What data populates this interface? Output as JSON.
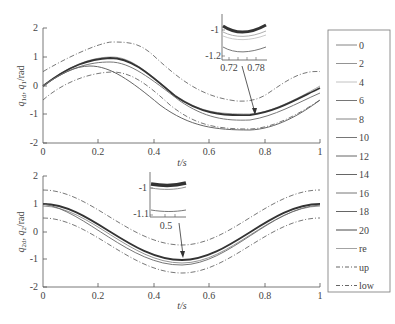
{
  "chart_data": [
    {
      "type": "line",
      "title": "",
      "xlabel": "t/s",
      "ylabel": "q1d, q1/rad",
      "ylabel_parts": {
        "a": "q",
        "a_sub": "1d",
        "sep": ", ",
        "b": "q",
        "b_sub": "1",
        "unit": "/rad"
      },
      "xlim": [
        0,
        1
      ],
      "ylim": [
        -2,
        2
      ],
      "xticks": [
        "0",
        "0.2",
        "0.4",
        "0.6",
        "0.8",
        "1"
      ],
      "yticks": [
        "2",
        "1",
        "0",
        "-1",
        "-2"
      ],
      "x": [
        0,
        0.1,
        0.2,
        0.25,
        0.3,
        0.4,
        0.5,
        0.6,
        0.7,
        0.75,
        0.8,
        0.9,
        1.0
      ],
      "series": [
        {
          "name": "up",
          "style": "dash-dot",
          "values": [
            0.5,
            1.09,
            1.45,
            1.5,
            1.45,
            1.09,
            0.5,
            -0.09,
            -0.45,
            -0.5,
            -0.45,
            -0.09,
            0.5
          ]
        },
        {
          "name": "re",
          "style": "solid",
          "values": [
            0.0,
            0.59,
            0.95,
            1.0,
            0.95,
            0.59,
            0.0,
            -0.59,
            -0.95,
            -1.0,
            -0.95,
            -0.59,
            0.0
          ]
        },
        {
          "name": "0",
          "style": "solid",
          "values": [
            0.0,
            0.55,
            0.7,
            0.68,
            0.6,
            0.3,
            -0.25,
            -0.75,
            -1.1,
            -1.18,
            -1.15,
            -0.9,
            -0.5
          ]
        },
        {
          "name": "low",
          "style": "dash-dot",
          "values": [
            -0.5,
            0.09,
            0.45,
            0.5,
            0.45,
            0.09,
            -0.5,
            -1.09,
            -1.45,
            -1.5,
            -1.45,
            -1.09,
            -0.5
          ]
        }
      ],
      "inset": {
        "xticks": [
          "0.72",
          "0.78"
        ],
        "yticks": [
          "-1",
          "-1.2"
        ],
        "points_to": [
          0.76,
          -1.0
        ]
      }
    },
    {
      "type": "line",
      "title": "",
      "xlabel": "t/s",
      "ylabel": "q2d, q2/rad",
      "ylabel_parts": {
        "a": "q",
        "a_sub": "2d",
        "sep": ", ",
        "b": "q",
        "b_sub": "2",
        "unit": "/rad"
      },
      "xlim": [
        0,
        1
      ],
      "ylim": [
        -2,
        2
      ],
      "xticks": [
        "0",
        "0.2",
        "0.4",
        "0.6",
        "0.8",
        "1"
      ],
      "yticks": [
        "2",
        "1",
        "0",
        "-1",
        "-2"
      ],
      "x": [
        0,
        0.1,
        0.2,
        0.3,
        0.4,
        0.5,
        0.6,
        0.7,
        0.8,
        0.9,
        1.0
      ],
      "series": [
        {
          "name": "up",
          "style": "dash-dot",
          "values": [
            1.5,
            1.31,
            0.81,
            0.19,
            -0.31,
            -0.5,
            -0.31,
            0.19,
            0.81,
            1.31,
            1.5
          ]
        },
        {
          "name": "re",
          "style": "solid",
          "values": [
            1.0,
            0.81,
            0.31,
            -0.31,
            -0.81,
            -1.0,
            -0.81,
            -0.31,
            0.31,
            0.81,
            1.0
          ]
        },
        {
          "name": "low",
          "style": "dash-dot",
          "values": [
            0.5,
            0.31,
            -0.19,
            -0.81,
            -1.31,
            -1.5,
            -1.31,
            -0.81,
            -0.19,
            0.31,
            0.5
          ]
        }
      ],
      "inset": {
        "xticks": [
          "0.5"
        ],
        "yticks": [
          "-1",
          "-1.1"
        ],
        "points_to": [
          0.5,
          -1.0
        ]
      }
    }
  ],
  "legend": {
    "entries": [
      {
        "label": "0",
        "style": "solid"
      },
      {
        "label": "2",
        "style": "solid"
      },
      {
        "label": "4",
        "style": "solid"
      },
      {
        "label": "6",
        "style": "solid"
      },
      {
        "label": "8",
        "style": "solid"
      },
      {
        "label": "10",
        "style": "solid"
      },
      {
        "label": "12",
        "style": "solid"
      },
      {
        "label": "14",
        "style": "solid"
      },
      {
        "label": "16",
        "style": "solid"
      },
      {
        "label": "18",
        "style": "solid"
      },
      {
        "label": "20",
        "style": "solid"
      },
      {
        "label": "re",
        "style": "solid"
      },
      {
        "label": "up",
        "style": "dash-dot"
      },
      {
        "label": "low",
        "style": "dash-dot"
      }
    ]
  },
  "colors": {
    "axis": "#555555",
    "line": "#666666",
    "dark": "#333333",
    "light": "#aaaaaa"
  }
}
